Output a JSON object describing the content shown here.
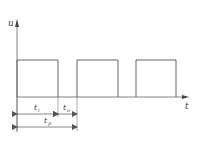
{
  "diagram": {
    "type": "pulse-waveform",
    "axes": {
      "y_label": "u",
      "x_label": "t"
    },
    "pulses": [
      {
        "start_x": 17,
        "end_x": 58
      },
      {
        "start_x": 77,
        "end_x": 118
      },
      {
        "start_x": 136,
        "end_x": 176
      }
    ],
    "dimensions": {
      "pulse_width": {
        "symbol": "t",
        "subscript": "i"
      },
      "off_time": {
        "symbol": "t",
        "subscript": "o"
      },
      "period": {
        "symbol": "t",
        "subscript": "p"
      }
    },
    "colors": {
      "line": "#555555",
      "background": "#ffffff"
    }
  }
}
